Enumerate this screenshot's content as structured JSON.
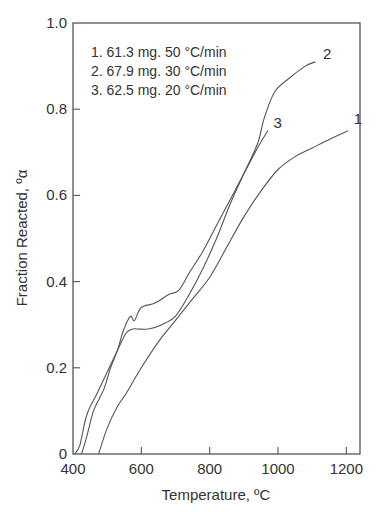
{
  "chart_data": {
    "type": "line",
    "title": "",
    "xlabel": "Temperature, ºC",
    "ylabel": "Fraction Reacted, ºα",
    "xlim": [
      400,
      1240
    ],
    "ylim": [
      0,
      1.0
    ],
    "x_ticks": [
      400,
      600,
      800,
      1000,
      1200
    ],
    "x_tick_labels": [
      "400",
      "600",
      "800",
      "1000",
      "1200"
    ],
    "y_ticks": [
      0,
      0.2,
      0.4,
      0.6,
      0.8,
      1.0
    ],
    "y_tick_labels": [
      "0",
      "0.2",
      "0.4",
      "0.6",
      "0.8",
      "1.0"
    ],
    "grid": false,
    "legend_position": "upper-left",
    "legend": [
      "1. 61.3 mg. 50 °C/min",
      "2. 67.9 mg. 30 °C/min",
      "3. 62.5 mg. 20 °C/min"
    ],
    "series": [
      {
        "name": "1",
        "label": "1. 61.3 mg. 50 °C/min",
        "x": [
          475,
          500,
          530,
          555,
          600,
          650,
          700,
          750,
          800,
          850,
          900,
          950,
          1000,
          1050,
          1100,
          1150,
          1205
        ],
        "y": [
          0.0,
          0.06,
          0.11,
          0.14,
          0.2,
          0.26,
          0.31,
          0.36,
          0.41,
          0.48,
          0.55,
          0.61,
          0.66,
          0.69,
          0.71,
          0.73,
          0.75
        ]
      },
      {
        "name": "2",
        "label": "2. 67.9 mg. 30 °C/min",
        "x": [
          405,
          420,
          440,
          470,
          500,
          530,
          555,
          575,
          590,
          620,
          660,
          700,
          740,
          780,
          820,
          860,
          900,
          940,
          960,
          990,
          1030,
          1080,
          1110
        ],
        "y": [
          0.0,
          0.02,
          0.09,
          0.14,
          0.19,
          0.24,
          0.28,
          0.29,
          0.29,
          0.29,
          0.3,
          0.32,
          0.37,
          0.43,
          0.5,
          0.58,
          0.65,
          0.72,
          0.78,
          0.84,
          0.87,
          0.9,
          0.91
        ]
      },
      {
        "name": "3",
        "label": "3. 62.5 mg. 20 °C/min",
        "x": [
          425,
          440,
          460,
          490,
          510,
          530,
          545,
          560,
          570,
          580,
          600,
          640,
          680,
          710,
          740,
          780,
          820,
          860,
          900,
          940,
          970
        ],
        "y": [
          0.0,
          0.04,
          0.1,
          0.15,
          0.2,
          0.24,
          0.28,
          0.31,
          0.32,
          0.31,
          0.34,
          0.35,
          0.37,
          0.38,
          0.42,
          0.47,
          0.53,
          0.59,
          0.65,
          0.71,
          0.75
        ]
      }
    ],
    "curve_labels": [
      {
        "text": "1",
        "x": 1210,
        "y": 0.77
      },
      {
        "text": "2",
        "x": 1120,
        "y": 0.92
      },
      {
        "text": "3",
        "x": 975,
        "y": 0.76
      }
    ],
    "colors": {
      "line": "#555555",
      "text": "#333333",
      "background": "#ffffff"
    }
  }
}
